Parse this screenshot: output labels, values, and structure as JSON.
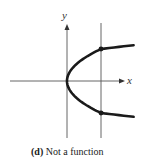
{
  "figure": {
    "x_axis_label": "x",
    "y_axis_label": "y",
    "curve": {
      "name": "parabola opening right",
      "equation": "x = y^2",
      "color": "#1a1a1a"
    },
    "vertical_test_line": {
      "x_value": 1,
      "intersections": [
        {
          "x": 1,
          "y": 1
        },
        {
          "x": 1,
          "y": -1
        }
      ]
    },
    "domain": {
      "x_range": [
        -1.7,
        1.0
      ],
      "y_range": [
        -1.7,
        1.7
      ]
    },
    "colors": {
      "axis": "#555555",
      "curve": "#1a1a1a",
      "point": "#1a1a1a",
      "text": "#222222"
    }
  },
  "caption": {
    "label": "(d)",
    "text": "Not a function"
  }
}
